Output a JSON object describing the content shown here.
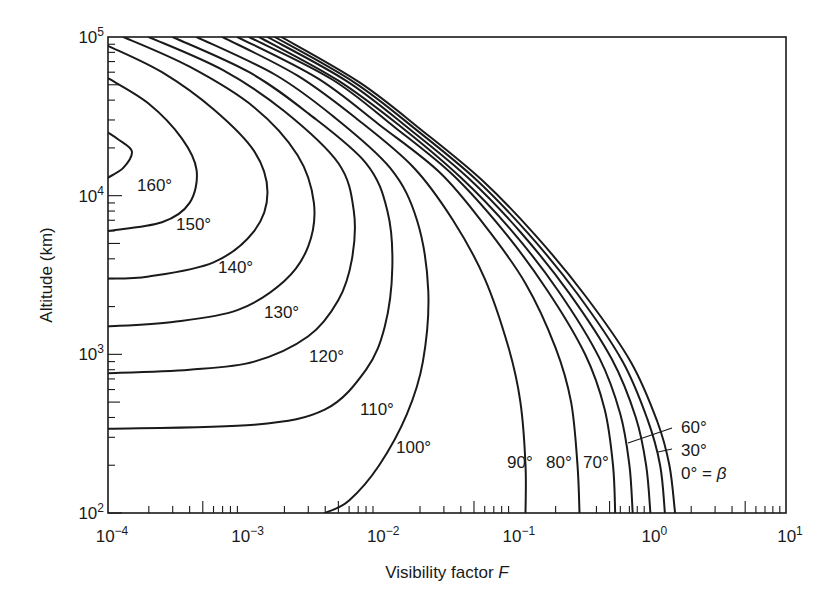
{
  "chart_data": {
    "type": "line",
    "title": "",
    "xlabel": "Visibility factor F",
    "ylabel": "Altitude (km)",
    "x_scale": "log",
    "y_scale": "log",
    "xlim": [
      0.0001,
      10
    ],
    "ylim": [
      100,
      100000
    ],
    "grid": false,
    "legend_position": "inline curve labels",
    "x_ticks": [
      {
        "base": "10",
        "exp": "−4",
        "value": 0.0001
      },
      {
        "base": "10",
        "exp": "−3",
        "value": 0.001
      },
      {
        "base": "10",
        "exp": "−2",
        "value": 0.01
      },
      {
        "base": "10",
        "exp": "−1",
        "value": 0.1
      },
      {
        "base": "10",
        "exp": "0",
        "value": 1
      },
      {
        "base": "10",
        "exp": "1",
        "value": 10
      }
    ],
    "y_ticks": [
      {
        "base": "10",
        "exp": "2",
        "value": 100
      },
      {
        "base": "10",
        "exp": "3",
        "value": 1000
      },
      {
        "base": "10",
        "exp": "4",
        "value": 10000
      },
      {
        "base": "10",
        "exp": "5",
        "value": 100000
      }
    ],
    "series": [
      {
        "name": "160°",
        "label": "160°",
        "points": [
          [
            0.0001,
            25000
          ],
          [
            0.00012,
            22500
          ],
          [
            0.00015,
            19000
          ],
          [
            0.00013,
            15000
          ],
          [
            0.0001,
            13000
          ]
        ]
      },
      {
        "name": "150°",
        "label": "150°",
        "points": [
          [
            0.0001,
            55000
          ],
          [
            0.0002,
            38000
          ],
          [
            0.00035,
            23000
          ],
          [
            0.00045,
            14500
          ],
          [
            0.0004,
            9000
          ],
          [
            0.00025,
            6800
          ],
          [
            0.0001,
            6000
          ]
        ]
      },
      {
        "name": "140°",
        "label": "140°",
        "points": [
          [
            0.0001,
            88000
          ],
          [
            0.00025,
            60000
          ],
          [
            0.0006,
            35000
          ],
          [
            0.0012,
            19000
          ],
          [
            0.0015,
            10500
          ],
          [
            0.0012,
            6000
          ],
          [
            0.0006,
            3800
          ],
          [
            0.0002,
            3100
          ],
          [
            0.0001,
            3000
          ]
        ]
      },
      {
        "name": "130°",
        "label": "130°",
        "points": [
          [
            0.00013,
            100000
          ],
          [
            0.0004,
            65000
          ],
          [
            0.0012,
            36000
          ],
          [
            0.0025,
            18000
          ],
          [
            0.0033,
            9000
          ],
          [
            0.003,
            4800
          ],
          [
            0.002,
            2900
          ],
          [
            0.0009,
            1900
          ],
          [
            0.0003,
            1600
          ],
          [
            0.0001,
            1500
          ]
        ]
      },
      {
        "name": "120°",
        "label": "120°",
        "points": [
          [
            0.0002,
            100000
          ],
          [
            0.0007,
            62000
          ],
          [
            0.002,
            34000
          ],
          [
            0.005,
            16000
          ],
          [
            0.0065,
            8000
          ],
          [
            0.0063,
            4000
          ],
          [
            0.005,
            2200
          ],
          [
            0.003,
            1300
          ],
          [
            0.0012,
            900
          ],
          [
            0.0004,
            800
          ],
          [
            0.0001,
            760
          ]
        ]
      },
      {
        "name": "110°",
        "label": "110°",
        "points": [
          [
            0.0003,
            100000
          ],
          [
            0.0011,
            60000
          ],
          [
            0.003,
            33000
          ],
          [
            0.008,
            16000
          ],
          [
            0.0115,
            8000
          ],
          [
            0.0125,
            3500
          ],
          [
            0.011,
            1500
          ],
          [
            0.008,
            800
          ],
          [
            0.004,
            450
          ],
          [
            0.0012,
            360
          ],
          [
            0.0001,
            340
          ]
        ]
      },
      {
        "name": "100°",
        "label": "100°",
        "points": [
          [
            0.00045,
            100000
          ],
          [
            0.0017,
            58000
          ],
          [
            0.0045,
            32000
          ],
          [
            0.012,
            15000
          ],
          [
            0.019,
            7000
          ],
          [
            0.023,
            2500
          ],
          [
            0.021,
            900
          ],
          [
            0.016,
            420
          ],
          [
            0.01,
            200
          ],
          [
            0.006,
            120
          ],
          [
            0.004,
            100
          ]
        ]
      },
      {
        "name": "90°",
        "label": "90°",
        "points": [
          [
            0.0007,
            100000
          ],
          [
            0.0025,
            57000
          ],
          [
            0.007,
            30000
          ],
          [
            0.018,
            15000
          ],
          [
            0.035,
            7000
          ],
          [
            0.06,
            3000
          ],
          [
            0.09,
            1100
          ],
          [
            0.11,
            500
          ],
          [
            0.12,
            200
          ],
          [
            0.12,
            100
          ]
        ]
      },
      {
        "name": "80°",
        "label": "80°",
        "points": [
          [
            0.0009,
            100000
          ],
          [
            0.0035,
            55000
          ],
          [
            0.01,
            28000
          ],
          [
            0.028,
            14000
          ],
          [
            0.06,
            6500
          ],
          [
            0.12,
            2800
          ],
          [
            0.2,
            1100
          ],
          [
            0.26,
            500
          ],
          [
            0.29,
            200
          ],
          [
            0.3,
            100
          ]
        ]
      },
      {
        "name": "70°",
        "label": "70°",
        "points": [
          [
            0.0011,
            100000
          ],
          [
            0.0045,
            54000
          ],
          [
            0.013,
            27000
          ],
          [
            0.035,
            13500
          ],
          [
            0.08,
            6200
          ],
          [
            0.17,
            2600
          ],
          [
            0.33,
            1000
          ],
          [
            0.46,
            450
          ],
          [
            0.53,
            200
          ],
          [
            0.55,
            100
          ]
        ]
      },
      {
        "name": "60°",
        "label": "60°",
        "points": [
          [
            0.0013,
            100000
          ],
          [
            0.005,
            53000
          ],
          [
            0.015,
            26500
          ],
          [
            0.04,
            13000
          ],
          [
            0.095,
            6000
          ],
          [
            0.21,
            2500
          ],
          [
            0.42,
            950
          ],
          [
            0.6,
            420
          ],
          [
            0.7,
            200
          ],
          [
            0.74,
            100
          ]
        ]
      },
      {
        "name": "50°",
        "label": "",
        "points": [
          [
            0.0015,
            100000
          ],
          [
            0.0058,
            52500
          ],
          [
            0.017,
            26000
          ],
          [
            0.046,
            12800
          ],
          [
            0.11,
            5900
          ],
          [
            0.25,
            2450
          ],
          [
            0.52,
            930
          ],
          [
            0.78,
            400
          ],
          [
            0.93,
            200
          ],
          [
            1.0,
            100
          ]
        ]
      },
      {
        "name": "30°",
        "label": "30°",
        "points": [
          [
            0.0017,
            100000
          ],
          [
            0.0065,
            52000
          ],
          [
            0.019,
            25800
          ],
          [
            0.052,
            12600
          ],
          [
            0.125,
            5800
          ],
          [
            0.29,
            2400
          ],
          [
            0.62,
            910
          ],
          [
            0.95,
            390
          ],
          [
            1.18,
            200
          ],
          [
            1.28,
            100
          ]
        ]
      },
      {
        "name": "0°",
        "label": "0° = β",
        "points": [
          [
            0.0019,
            100000
          ],
          [
            0.0072,
            51500
          ],
          [
            0.021,
            25500
          ],
          [
            0.058,
            12400
          ],
          [
            0.14,
            5700
          ],
          [
            0.33,
            2350
          ],
          [
            0.72,
            890
          ],
          [
            1.12,
            380
          ],
          [
            1.38,
            200
          ],
          [
            1.52,
            100
          ]
        ]
      }
    ],
    "annotations": [
      {
        "text": "160°",
        "x": 0.00017,
        "y": 12500
      },
      {
        "text": "150°",
        "x": 0.00042,
        "y": 6900
      },
      {
        "text": "140°",
        "x": 0.00105,
        "y": 3800
      },
      {
        "text": "130°",
        "x": 0.0026,
        "y": 2100
      },
      {
        "text": "120°",
        "x": 0.0065,
        "y": 1150
      },
      {
        "text": "110°",
        "x": 0.016,
        "y": 650
      },
      {
        "text": "100°",
        "x": 0.03,
        "y": 330
      },
      {
        "text": "90°",
        "x": 0.073,
        "y": 150
      },
      {
        "text": "80°",
        "x": 0.14,
        "y": 150
      },
      {
        "text": "70°",
        "x": 0.24,
        "y": 150
      },
      {
        "text": "60°",
        "x": 1.4,
        "y": 290
      },
      {
        "text": "30°",
        "x": 1.4,
        "y": 210
      },
      {
        "text": "0° = β",
        "x": 1.4,
        "y": 155
      }
    ]
  },
  "labels": {
    "xlabel_text": "Visibility factor ",
    "xlabel_var": "F",
    "ylabel": "Altitude (km)",
    "curve_labels": {
      "l160": "160°",
      "l150": "150°",
      "l140": "140°",
      "l130": "130°",
      "l120": "120°",
      "l110": "110°",
      "l100": "100°",
      "l90": "90°",
      "l80": "80°",
      "l70": "70°",
      "l60": "60°",
      "l30": "30°",
      "l0a": "0° = ",
      "l0b": "β"
    }
  }
}
